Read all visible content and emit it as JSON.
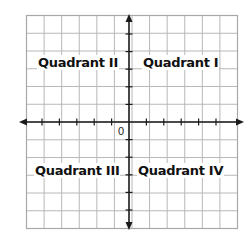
{
  "diagram": {
    "title": "",
    "type": "coordinate-plane",
    "grid": {
      "columns": 12,
      "rows": 12,
      "line_color": "#b8b8b8",
      "border_color": "#a8a8a8"
    },
    "axes": {
      "color": "#1a1a1a",
      "arrows": true,
      "ticks_per_side": 5
    },
    "origin_label": "0",
    "quadrants": [
      {
        "id": "I",
        "label": "Quadrant I"
      },
      {
        "id": "II",
        "label": "Quadrant II"
      },
      {
        "id": "III",
        "label": "Quadrant III"
      },
      {
        "id": "IV",
        "label": "Quadrant IV"
      }
    ]
  }
}
